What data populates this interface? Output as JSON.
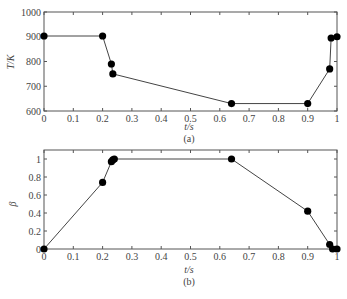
{
  "chart_data": [
    {
      "type": "line",
      "panel": "(a)",
      "title": "",
      "xlabel": "t/s",
      "ylabel": "T/K",
      "xlim": [
        0,
        1
      ],
      "ylim": [
        600,
        1000
      ],
      "xticks": [
        "0",
        "0.1",
        "0.2",
        "0.3",
        "0.4",
        "0.5",
        "0.6",
        "0.7",
        "0.8",
        "0.9",
        "1"
      ],
      "yticks": [
        "600",
        "700",
        "800",
        "900",
        "1000"
      ],
      "grid": false,
      "markers": "filled-circle",
      "x": [
        0,
        0.2,
        0.23,
        0.235,
        0.64,
        0.9,
        0.975,
        0.98,
        1.0
      ],
      "y": [
        903,
        903,
        790,
        750,
        630,
        630,
        770,
        895,
        900
      ]
    },
    {
      "type": "line",
      "panel": "(b)",
      "title": "",
      "xlabel": "t/s",
      "ylabel": "β",
      "xlim": [
        0,
        1
      ],
      "ylim": [
        0,
        1.1
      ],
      "xticks": [
        "0",
        "0.1",
        "0.2",
        "0.3",
        "0.4",
        "0.5",
        "0.6",
        "0.7",
        "0.8",
        "0.9",
        "1"
      ],
      "yticks": [
        "0",
        "0.2",
        "0.4",
        "0.6",
        "0.8",
        "1"
      ],
      "grid": false,
      "markers": "filled-circle",
      "x": [
        0,
        0.2,
        0.23,
        0.235,
        0.24,
        0.64,
        0.9,
        0.975,
        0.985,
        1.0
      ],
      "y": [
        0,
        0.74,
        0.97,
        0.99,
        1.0,
        1.0,
        0.42,
        0.05,
        0.0,
        0.0
      ]
    }
  ],
  "labels": {
    "top_ylabel": "T/K",
    "top_xlabel": "t/s",
    "top_caption": "(a)",
    "bottom_ylabel": "β",
    "bottom_xlabel": "t/s",
    "bottom_caption": "(b)"
  }
}
